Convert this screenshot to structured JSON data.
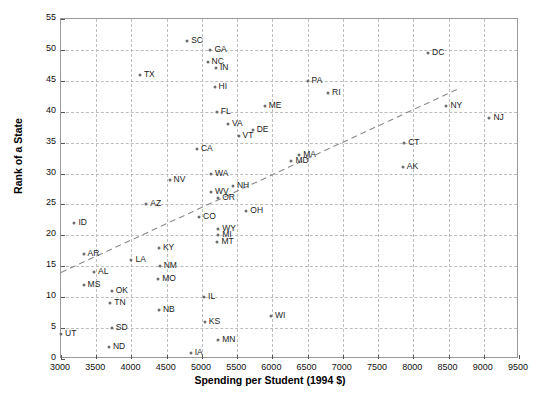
{
  "chart_data": {
    "type": "scatter",
    "title": "",
    "xlabel": "Spending per Student (1994 $)",
    "ylabel": "Rank of a State",
    "xlim": [
      3000,
      9500
    ],
    "ylim": [
      0,
      55
    ],
    "xticks": [
      3000,
      3500,
      4000,
      4500,
      5000,
      5500,
      6000,
      6500,
      7000,
      7500,
      8000,
      8500,
      9000,
      9500
    ],
    "yticks": [
      0,
      5,
      10,
      15,
      20,
      25,
      30,
      35,
      40,
      45,
      50,
      55
    ],
    "grid": true,
    "legend": "none",
    "marker_color": "#6e6e6e",
    "grid_color": "#bdbdbd",
    "trendline": {
      "style": "dashed",
      "color": "#8a8a8a",
      "x0": 3000,
      "y0": 14.0,
      "x1": 8620,
      "y1": 43.6
    },
    "points": [
      {
        "label": "UT",
        "x": 3000,
        "y": 4,
        "lx": 1
      },
      {
        "label": "ID",
        "x": 3190,
        "y": 22,
        "lx": 1
      },
      {
        "label": "AR",
        "x": 3320,
        "y": 17,
        "lx": 1
      },
      {
        "label": "MS",
        "x": 3320,
        "y": 12,
        "lx": 1
      },
      {
        "label": "AL",
        "x": 3470,
        "y": 14,
        "lx": 1
      },
      {
        "label": "TN",
        "x": 3700,
        "y": 9,
        "lx": 1
      },
      {
        "label": "OK",
        "x": 3720,
        "y": 11,
        "lx": 1
      },
      {
        "label": "SD",
        "x": 3720,
        "y": 5,
        "lx": 1
      },
      {
        "label": "ND",
        "x": 3680,
        "y": 2,
        "lx": 1
      },
      {
        "label": "LA",
        "x": 4000,
        "y": 16,
        "lx": 1
      },
      {
        "label": "AZ",
        "x": 4210,
        "y": 25,
        "lx": 1
      },
      {
        "label": "TX",
        "x": 4120,
        "y": 46,
        "lx": 1
      },
      {
        "label": "KY",
        "x": 4390,
        "y": 18,
        "lx": 1
      },
      {
        "label": "NM",
        "x": 4400,
        "y": 15,
        "lx": 1
      },
      {
        "label": "MO",
        "x": 4380,
        "y": 13,
        "lx": 1
      },
      {
        "label": "NB",
        "x": 4390,
        "y": 8,
        "lx": 1
      },
      {
        "label": "NV",
        "x": 4540,
        "y": 29,
        "lx": 1
      },
      {
        "label": "IA",
        "x": 4840,
        "y": 1,
        "lx": 1
      },
      {
        "label": "SC",
        "x": 4790,
        "y": 51.5,
        "lx": 1
      },
      {
        "label": "CA",
        "x": 4930,
        "y": 34,
        "lx": 1
      },
      {
        "label": "CO",
        "x": 4960,
        "y": 23,
        "lx": 1
      },
      {
        "label": "IL",
        "x": 5030,
        "y": 10,
        "lx": 1
      },
      {
        "label": "KS",
        "x": 5040,
        "y": 6,
        "lx": 1
      },
      {
        "label": "NC",
        "x": 5080,
        "y": 48,
        "lx": 1
      },
      {
        "label": "GA",
        "x": 5120,
        "y": 50,
        "lx": 1
      },
      {
        "label": "WA",
        "x": 5130,
        "y": 30,
        "lx": 1
      },
      {
        "label": "WV",
        "x": 5130,
        "y": 27,
        "lx": 1
      },
      {
        "label": "IN",
        "x": 5200,
        "y": 47,
        "lx": 1
      },
      {
        "label": "HI",
        "x": 5180,
        "y": 44,
        "lx": 1
      },
      {
        "label": "FL",
        "x": 5210,
        "y": 40,
        "lx": 1
      },
      {
        "label": "OR",
        "x": 5230,
        "y": 26,
        "lx": 1
      },
      {
        "label": "WY",
        "x": 5230,
        "y": 21,
        "lx": 1
      },
      {
        "label": "MI",
        "x": 5230,
        "y": 20,
        "lx": 1
      },
      {
        "label": "MT",
        "x": 5220,
        "y": 19,
        "lx": 1
      },
      {
        "label": "MN",
        "x": 5230,
        "y": 3,
        "lx": 1
      },
      {
        "label": "VA",
        "x": 5370,
        "y": 38,
        "lx": 1
      },
      {
        "label": "NH",
        "x": 5440,
        "y": 28,
        "lx": 1
      },
      {
        "label": "VT",
        "x": 5520,
        "y": 36,
        "lx": 1
      },
      {
        "label": "OH",
        "x": 5630,
        "y": 24,
        "lx": 1
      },
      {
        "label": "DE",
        "x": 5720,
        "y": 37,
        "lx": 1
      },
      {
        "label": "ME",
        "x": 5890,
        "y": 41,
        "lx": 1
      },
      {
        "label": "WI",
        "x": 5980,
        "y": 7,
        "lx": 1
      },
      {
        "label": "MD",
        "x": 6270,
        "y": 32,
        "lx": 1
      },
      {
        "label": "MA",
        "x": 6380,
        "y": 33,
        "lx": 1
      },
      {
        "label": "PA",
        "x": 6500,
        "y": 45,
        "lx": 1
      },
      {
        "label": "RI",
        "x": 6790,
        "y": 43,
        "lx": 1
      },
      {
        "label": "AK",
        "x": 7850,
        "y": 31,
        "lx": 1
      },
      {
        "label": "CT",
        "x": 7870,
        "y": 35,
        "lx": 1
      },
      {
        "label": "DC",
        "x": 8210,
        "y": 49.5,
        "lx": 1
      },
      {
        "label": "NY",
        "x": 8470,
        "y": 41,
        "lx": 1
      },
      {
        "label": "NJ",
        "x": 9080,
        "y": 39,
        "lx": 1
      }
    ]
  }
}
